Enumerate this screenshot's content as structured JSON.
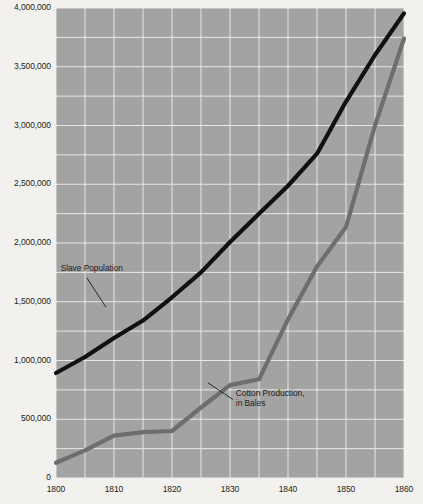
{
  "chart_data": {
    "type": "line",
    "title": "",
    "xlabel": "",
    "ylabel": "",
    "xlim": [
      1800,
      1860
    ],
    "ylim": [
      0,
      4000000
    ],
    "xticks": [
      1800,
      1810,
      1820,
      1830,
      1840,
      1850,
      1860
    ],
    "xtick_labels": [
      "1800",
      "1810",
      "1820",
      "1830",
      "1840",
      "1850",
      "1860"
    ],
    "yticks": [
      0,
      500000,
      1000000,
      1500000,
      2000000,
      2500000,
      3000000,
      3500000,
      4000000
    ],
    "ytick_labels": [
      "0",
      "500,000",
      "1,000,000",
      "1,500,000",
      "2,000,000",
      "2,500,000",
      "3,000,000",
      "3,500,000",
      "4,000,000"
    ],
    "grid": true,
    "grid_color": "#f0efec",
    "grid_x_minor_step": 5,
    "grid_y_minor_step": 250000,
    "plot_background": "#a3a3a3",
    "page_background": "#f2f1ee",
    "legend_position": "inline-annotations",
    "series": [
      {
        "name": "Slave Population",
        "color": "#111111",
        "width": 4.2,
        "x": [
          1800,
          1805,
          1810,
          1815,
          1820,
          1825,
          1830,
          1835,
          1840,
          1845,
          1850,
          1855,
          1860
        ],
        "values": [
          893600,
          1030000,
          1191400,
          1340000,
          1538000,
          1750000,
          2009000,
          2250000,
          2487000,
          2760000,
          3204000,
          3600000,
          3954000
        ]
      },
      {
        "name": "Cotton Production, in Bales",
        "color": "#6e6e6e",
        "width": 4.2,
        "x": [
          1800,
          1805,
          1810,
          1815,
          1820,
          1825,
          1830,
          1835,
          1840,
          1845,
          1850,
          1855,
          1860
        ],
        "values": [
          130000,
          235000,
          360000,
          390000,
          400000,
          600000,
          790000,
          840000,
          1350000,
          1800000,
          2136000,
          3000000,
          3740000
        ]
      }
    ],
    "annotations": [
      {
        "name": "slave-population-label",
        "lines": [
          "Slave Population"
        ],
        "text_x": 1800.8,
        "text_y": 1760000,
        "leader_from_x": 1805.3,
        "leader_from_y": 1705000,
        "leader_to_x": 1808.6,
        "leader_to_y": 1455000
      },
      {
        "name": "cotton-production-label",
        "lines": [
          "Cotton Production,",
          "in Bales"
        ],
        "text_x": 1831.0,
        "text_y": 700000,
        "leader_from_x": 1830.5,
        "leader_from_y": 668000,
        "leader_to_x": 1826.2,
        "leader_to_y": 810000
      }
    ]
  }
}
